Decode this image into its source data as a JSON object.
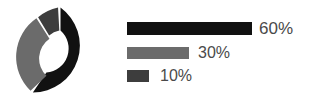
{
  "chart_data": {
    "type": "pie",
    "variant": "donut",
    "title": "",
    "categories": [
      "Series 1",
      "Series 2",
      "Series 3"
    ],
    "values": [
      60,
      30,
      10
    ],
    "labels": [
      "60%",
      "30%",
      "10%"
    ],
    "colors": [
      "#111111",
      "#6b6b6b",
      "#3d3d3d"
    ],
    "legend_position": "right",
    "grid": false,
    "start_angle_deg": 0,
    "gap_deg": 3,
    "slices": [
      {
        "label": "60%",
        "value": 60,
        "color": "#111111"
      },
      {
        "label": "30%",
        "value": 30,
        "color": "#6b6b6b"
      },
      {
        "label": "10%",
        "value": 10,
        "color": "#3d3d3d"
      }
    ]
  },
  "donut": {
    "name": "donut-chart",
    "hole_ratio": 0.51,
    "segments": [
      {
        "name": "segment-60",
        "color": "#111111",
        "percent": 60
      },
      {
        "name": "segment-30",
        "color": "#6b6b6b",
        "percent": 30
      },
      {
        "name": "segment-10",
        "color": "#3d3d3d",
        "percent": 10
      }
    ]
  },
  "legend": {
    "rows": [
      {
        "label": "60%",
        "color": "#111111",
        "bar_width": 125
      },
      {
        "label": "30%",
        "color": "#6b6b6b",
        "bar_width": 62
      },
      {
        "label": "10%",
        "color": "#3d3d3d",
        "bar_width": 22
      }
    ]
  },
  "colors": {
    "background": "#ffffff",
    "dark": "#111111",
    "mid_gray": "#6b6b6b",
    "dark_gray": "#3d3d3d",
    "text": "#4a4a4a"
  }
}
